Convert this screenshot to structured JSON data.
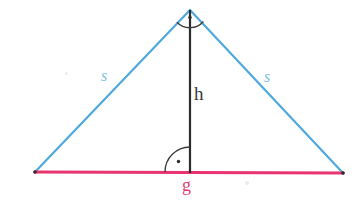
{
  "figure": {
    "canvas": {
      "width": 364,
      "height": 202,
      "background": "#ffffff"
    },
    "colors": {
      "sides": "#4fa9dd",
      "base": "#e8336f",
      "height": "#2b2b2b",
      "angle_mark": "#3a3a3a",
      "side_label": "#7dc2e8",
      "base_label": "#e33b74",
      "height_label": "#3a3a3a"
    },
    "vertices": {
      "apex": {
        "x": 190,
        "y": 10
      },
      "bottom_left": {
        "x": 35,
        "y": 172
      },
      "bottom_right": {
        "x": 343,
        "y": 173
      },
      "foot_of_height": {
        "x": 190,
        "y": 172
      }
    },
    "segments": [
      {
        "name": "left-side",
        "from": "bottom_left",
        "to": "apex",
        "color": "#4fa9dd",
        "width": 2,
        "label": "s"
      },
      {
        "name": "right-side",
        "from": "apex",
        "to": "bottom_right",
        "color": "#4fa9dd",
        "width": 2,
        "label": "s"
      },
      {
        "name": "base",
        "from": "bottom_left",
        "to": "bottom_right",
        "color": "#e8336f",
        "width": 3,
        "label": "g"
      },
      {
        "name": "height",
        "from": "apex",
        "to": "foot_of_height",
        "color": "#2b2b2b",
        "width": 2,
        "label": "h"
      }
    ],
    "labels": {
      "side_left": "s",
      "side_right": "s",
      "height": "h",
      "base": "g"
    },
    "angle_marks": [
      {
        "name": "apex-angle-arc",
        "center": {
          "x": 190,
          "y": 10
        },
        "radius": 18,
        "dot": {
          "x": 190,
          "y": 17
        }
      },
      {
        "name": "base-right-angle-arc",
        "center": {
          "x": 190,
          "y": 172
        },
        "radius": 25,
        "dot": {
          "x": 178,
          "y": 162
        }
      }
    ],
    "specks": [
      {
        "x": 66,
        "y": 73,
        "r": 1.6
      },
      {
        "x": 247,
        "y": 183,
        "r": 2.0
      }
    ]
  }
}
